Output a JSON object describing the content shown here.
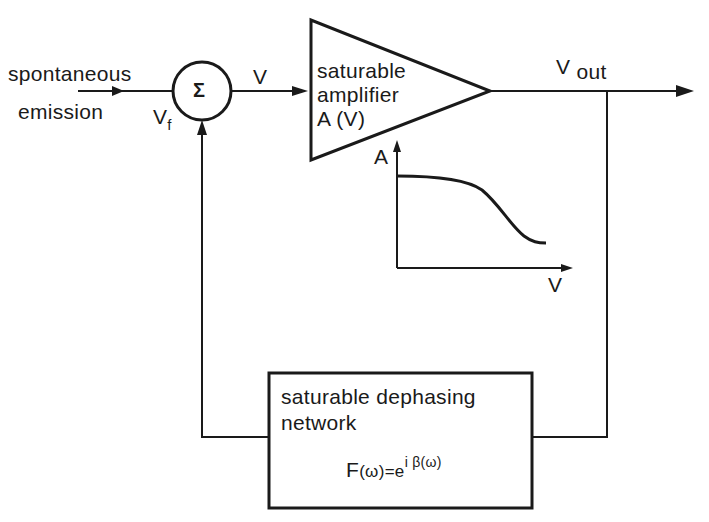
{
  "diagram": {
    "input": {
      "line1": "spontaneous",
      "line2": "emission"
    },
    "summer": {
      "symbol": "Σ",
      "feedback_label": "V",
      "feedback_sub": "f"
    },
    "signal_label": "V",
    "amplifier": {
      "line1": "saturable",
      "line2": "amplifier",
      "line3": "A (V)"
    },
    "output": {
      "label": "V",
      "label_sub": "out"
    },
    "gain_plot": {
      "y_axis": "A",
      "x_axis": "V"
    },
    "network": {
      "line1": "saturable dephasing",
      "line2": "network",
      "formula_left": "F",
      "formula_arg": "(ω)=e",
      "formula_exp": "i β(ω)"
    }
  },
  "colors": {
    "stroke": "#1a1a1a",
    "background": "#ffffff"
  }
}
